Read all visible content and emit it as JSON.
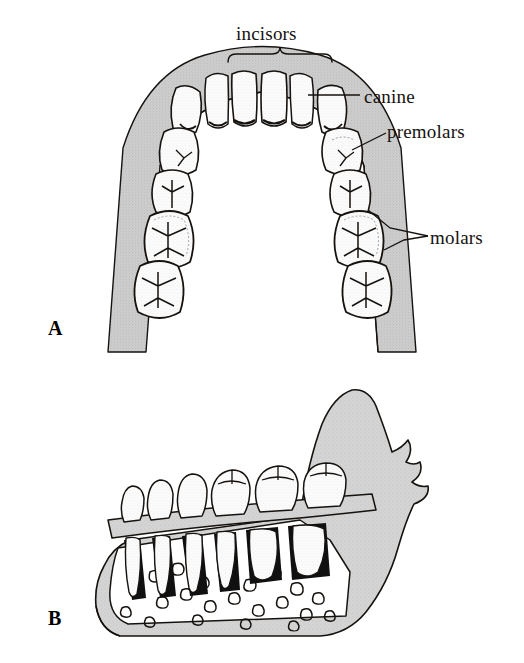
{
  "figure": {
    "background_color": "#ffffff",
    "ink_color": "#16120f",
    "gum_gray": "#c9c9c9",
    "bone_gray": "#cfcfcf",
    "enamel_white": "#fdfdfd",
    "pulp_gray": "#d8d8d8"
  },
  "annotations": {
    "incisors": {
      "label": "incisors",
      "marker": "brace",
      "points_to": "four front teeth of lower arch"
    },
    "canine": {
      "label": "canine",
      "marker": "leader-line",
      "points_to": "third tooth from midline, right side"
    },
    "premolars": {
      "label": "premolars",
      "marker": "leader-line",
      "points_to": "two teeth distal to canine, right side"
    },
    "molars": {
      "label": "molars",
      "marker": "leader-line",
      "points_to": "three rearmost teeth, right side"
    }
  },
  "panels": [
    {
      "letter": "A",
      "view": "occlusal view of the lower (mandibular) dental arch",
      "tooth_count": 16,
      "tooth_groups": [
        "incisors",
        "canine",
        "premolars",
        "molars"
      ]
    },
    {
      "letter": "B",
      "view": "lateral cutaway of the mandible showing tooth roots set in trabecular bone, with maxillary crowns above",
      "features": [
        "crowns",
        "roots",
        "alveolar bone",
        "trabecular bone",
        "ramus",
        "coronoid process",
        "condylar process"
      ]
    }
  ]
}
